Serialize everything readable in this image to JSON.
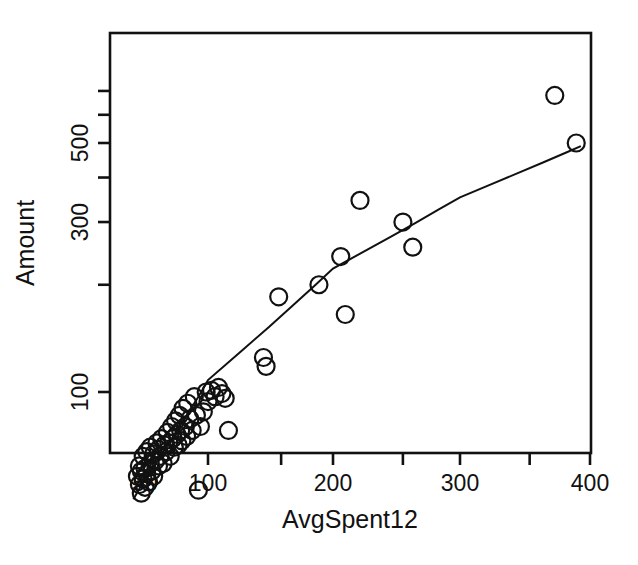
{
  "chart_data": {
    "type": "scatter",
    "title": "",
    "xlabel": "AvgSpent12",
    "ylabel": "Amount",
    "xscale": "log",
    "yscale": "log",
    "xlim": [
      44,
      420
    ],
    "ylim": [
      40,
      780
    ],
    "grid": false,
    "legend": "none",
    "x_ticks_labeled": [
      50,
      100,
      200,
      300,
      400
    ],
    "x_tick_labels": [
      "50",
      "100",
      "200",
      "300",
      "400"
    ],
    "x_ticks_minor": [
      150,
      250,
      350
    ],
    "y_ticks_labeled": [
      100,
      300,
      500
    ],
    "y_tick_labels": [
      "100",
      "300",
      "500"
    ],
    "y_ticks_minor": [
      200,
      400,
      600,
      700
    ],
    "marker": "open-circle",
    "marker_color": "#111111",
    "line_color": "#111111",
    "points": [
      [
        46,
        58
      ],
      [
        47,
        55
      ],
      [
        47,
        62
      ],
      [
        48,
        52
      ],
      [
        48,
        60
      ],
      [
        49,
        57
      ],
      [
        49,
        66
      ],
      [
        50,
        54
      ],
      [
        50,
        61
      ],
      [
        51,
        59
      ],
      [
        51,
        68
      ],
      [
        52,
        56
      ],
      [
        53,
        63
      ],
      [
        53,
        70
      ],
      [
        54,
        60
      ],
      [
        55,
        58
      ],
      [
        55,
        67
      ],
      [
        56,
        64
      ],
      [
        57,
        72
      ],
      [
        58,
        62
      ],
      [
        58,
        69
      ],
      [
        59,
        66
      ],
      [
        60,
        74
      ],
      [
        61,
        63
      ],
      [
        62,
        71
      ],
      [
        63,
        68
      ],
      [
        64,
        77
      ],
      [
        65,
        72
      ],
      [
        66,
        66
      ],
      [
        67,
        80
      ],
      [
        68,
        74
      ],
      [
        69,
        70
      ],
      [
        70,
        83
      ],
      [
        71,
        76
      ],
      [
        72,
        71
      ],
      [
        73,
        86
      ],
      [
        74,
        78
      ],
      [
        75,
        73
      ],
      [
        76,
        90
      ],
      [
        78,
        80
      ],
      [
        79,
        75
      ],
      [
        80,
        93
      ],
      [
        82,
        84
      ],
      [
        84,
        78
      ],
      [
        86,
        97
      ],
      [
        88,
        86
      ],
      [
        90,
        53
      ],
      [
        92,
        80
      ],
      [
        95,
        88
      ],
      [
        98,
        100
      ],
      [
        100,
        94
      ],
      [
        102,
        101
      ],
      [
        104,
        97
      ],
      [
        106,
        103
      ],
      [
        108,
        99
      ],
      [
        110,
        96
      ],
      [
        112,
        78
      ],
      [
        136,
        125
      ],
      [
        138,
        118
      ],
      [
        148,
        185
      ],
      [
        185,
        200
      ],
      [
        205,
        240
      ],
      [
        208,
        165
      ],
      [
        218,
        345
      ],
      [
        250,
        300
      ],
      [
        258,
        255
      ],
      [
        370,
        680
      ],
      [
        388,
        500
      ]
    ],
    "fit_curve": [
      [
        44,
        50
      ],
      [
        50,
        57
      ],
      [
        60,
        67
      ],
      [
        70,
        77
      ],
      [
        80,
        87
      ],
      [
        90,
        97
      ],
      [
        100,
        108
      ],
      [
        120,
        130
      ],
      [
        140,
        152
      ],
      [
        160,
        175
      ],
      [
        180,
        198
      ],
      [
        200,
        222
      ],
      [
        220,
        247
      ],
      [
        240,
        272
      ],
      [
        260,
        298
      ],
      [
        280,
        325
      ],
      [
        300,
        352
      ],
      [
        320,
        381
      ],
      [
        340,
        410
      ],
      [
        360,
        440
      ],
      [
        380,
        471
      ],
      [
        392,
        490
      ]
    ]
  },
  "axes": {
    "x_title": "AvgSpent12",
    "y_title": "Amount"
  }
}
